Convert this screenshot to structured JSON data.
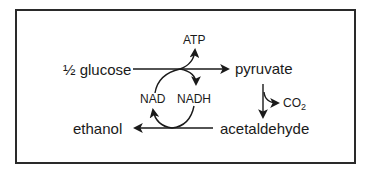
{
  "diagram": {
    "nodes": {
      "glucose": "½ glucose",
      "pyruvate": "pyruvate",
      "acetaldehyde": "acetaldehyde",
      "ethanol": "ethanol"
    },
    "side_products": {
      "atp": "ATP",
      "co2_main": "CO",
      "co2_sub": "2"
    },
    "cofactors": {
      "nad": "NAD",
      "nadh": "NADH"
    },
    "edges": [
      {
        "from": "½ glucose",
        "to": "pyruvate",
        "side": "ATP produced; NAD → NADH"
      },
      {
        "from": "pyruvate",
        "to": "acetaldehyde",
        "side": "CO2 released"
      },
      {
        "from": "acetaldehyde",
        "to": "ethanol",
        "side": "NADH → NAD"
      }
    ],
    "colors": {
      "stroke": "#1a1a1a",
      "border": "#2a2a2a",
      "background": "#ffffff"
    }
  }
}
